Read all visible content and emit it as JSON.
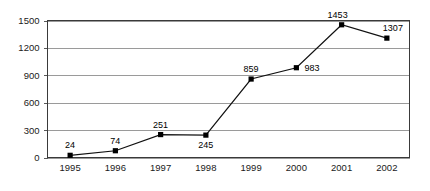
{
  "chart_data": {
    "type": "line",
    "title": "",
    "subtitle": "",
    "xlabel": "",
    "ylabel": "",
    "categories": [
      "1995",
      "1996",
      "1997",
      "1998",
      "1999",
      "2000",
      "2001",
      "2002"
    ],
    "values": [
      24,
      74,
      251,
      245,
      859,
      983,
      1453,
      1307
    ],
    "series": [
      {
        "name": "",
        "values": [
          24,
          74,
          251,
          245,
          859,
          983,
          1453,
          1307
        ]
      }
    ],
    "point_labels": [
      "24",
      "74",
      "251",
      "245",
      "859",
      "983",
      "1453",
      "1307"
    ],
    "label_placement": [
      "above",
      "above",
      "above",
      "below",
      "above",
      "right",
      "above-left",
      "above-right"
    ],
    "ylim": [
      0,
      1500
    ],
    "yticks": [
      0,
      300,
      600,
      900,
      1200,
      1500
    ],
    "ytick_labels": [
      "0",
      "300",
      "600",
      "900",
      "1200",
      "1500"
    ],
    "xtick_labels": [
      "1995",
      "1996",
      "1997",
      "1998",
      "1999",
      "2000",
      "2001",
      "2002"
    ],
    "grid": true,
    "grid_axis": "y",
    "legend": false,
    "legend_position": "none",
    "marker": "square",
    "colors": {
      "line": "#111111",
      "marker": "#000000",
      "grid": "#9a9a9a",
      "frame": "#3a3a3a",
      "text": "#1a1a1a",
      "background": "#ffffff"
    }
  }
}
